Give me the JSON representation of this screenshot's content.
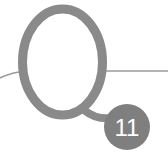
{
  "question_marker": {
    "letter": "Q",
    "number": "11"
  },
  "colors": {
    "letter_stroke": "#8a8a8a",
    "rule_line": "#9a9a9a",
    "badge_fill": "#7f7f7f",
    "badge_text": "#ffffff",
    "background": "#ffffff"
  }
}
